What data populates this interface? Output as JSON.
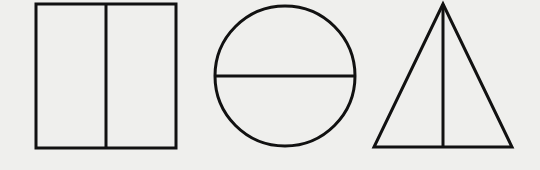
{
  "figure": {
    "background": "#efefed",
    "stroke_color": "#111111",
    "stroke_width": 3,
    "shapes": [
      {
        "name": "rectangle",
        "x": 36,
        "y": 4,
        "width": 140,
        "height": 144,
        "divider": "vertical",
        "divider_x": 106
      },
      {
        "name": "circle",
        "cx": 285,
        "cy": 76,
        "r": 70,
        "divider": "horizontal",
        "divider_y": 76
      },
      {
        "name": "triangle",
        "apex": [
          443,
          4
        ],
        "base_left": [
          374,
          147
        ],
        "base_right": [
          512,
          147
        ],
        "divider": "vertical",
        "divider_x": 443
      }
    ]
  }
}
